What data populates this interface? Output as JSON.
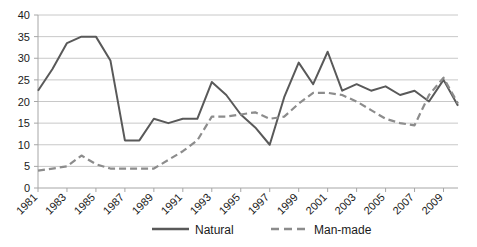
{
  "chart_data": {
    "type": "line",
    "title": "",
    "xlabel": "",
    "ylabel": "",
    "xlim": [
      1981,
      2010
    ],
    "ylim": [
      0,
      40
    ],
    "yticks": [
      0,
      5,
      10,
      15,
      20,
      25,
      30,
      35,
      40
    ],
    "xticks": [
      1981,
      1983,
      1985,
      1987,
      1989,
      1991,
      1993,
      1995,
      1997,
      1999,
      2001,
      2003,
      2005,
      2007,
      2009
    ],
    "xtick_labels": [
      "1981",
      "1983",
      "1985",
      "1987",
      "1989",
      "1991",
      "1993",
      "1995",
      "1997",
      "1999",
      "2001",
      "2003",
      "2005",
      "2007",
      "2009"
    ],
    "ytick_labels": [
      "0",
      "5",
      "10",
      "15",
      "20",
      "25",
      "30",
      "35",
      "40"
    ],
    "grid": true,
    "grid_axis": "y",
    "legend_position": "bottom",
    "x": [
      1981,
      1982,
      1983,
      1984,
      1985,
      1986,
      1987,
      1988,
      1989,
      1990,
      1991,
      1992,
      1993,
      1994,
      1995,
      1996,
      1997,
      1998,
      1999,
      2000,
      2001,
      2002,
      2003,
      2004,
      2005,
      2006,
      2007,
      2008,
      2009,
      2010
    ],
    "series": [
      {
        "name": "Natural",
        "style": "solid",
        "color": "#595959",
        "values": [
          22.5,
          27.5,
          33.5,
          35.0,
          35.0,
          29.5,
          11.0,
          11.0,
          16.0,
          15.0,
          16.0,
          16.0,
          24.5,
          21.5,
          17.0,
          14.0,
          10.0,
          21.0,
          29.0,
          24.0,
          31.5,
          22.5,
          24.0,
          22.5,
          23.5,
          21.5,
          22.5,
          20.0,
          25.0,
          19.0
        ]
      },
      {
        "name": "Man-made",
        "style": "dashed",
        "color": "#8c8c8c",
        "values": [
          4.0,
          4.5,
          5.0,
          7.5,
          5.5,
          4.5,
          4.5,
          4.5,
          4.5,
          6.5,
          8.5,
          11.0,
          16.5,
          16.5,
          17.0,
          17.5,
          16.0,
          16.5,
          19.5,
          22.0,
          22.0,
          21.5,
          20.0,
          18.0,
          16.0,
          15.0,
          14.5,
          21.5,
          25.5,
          19.5
        ]
      }
    ]
  },
  "legend": {
    "items": [
      {
        "label": "Natural",
        "style": "solid"
      },
      {
        "label": "Man-made",
        "style": "dashed"
      }
    ]
  },
  "colors": {
    "natural": "#595959",
    "manmade": "#8c8c8c",
    "grid": "#c8c8c8",
    "axis": "#a6a6a6",
    "text": "#1a1a1a",
    "background": "#ffffff"
  }
}
